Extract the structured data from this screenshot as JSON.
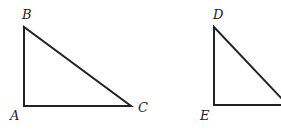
{
  "diagram": {
    "type": "geometry",
    "triangles": [
      {
        "name": "triangle-abc",
        "vertices": {
          "A": {
            "label": "A",
            "x": 24,
            "y": 106
          },
          "B": {
            "label": "B",
            "x": 24,
            "y": 27
          },
          "C": {
            "label": "C",
            "x": 131,
            "y": 106
          }
        },
        "right_angle_at": "A"
      },
      {
        "name": "triangle-def",
        "vertices": {
          "D": {
            "label": "D",
            "x": 214,
            "y": 27
          },
          "E": {
            "label": "E",
            "x": 214,
            "y": 105
          }
        },
        "right_angle_at": "E",
        "clipped": true
      }
    ]
  }
}
